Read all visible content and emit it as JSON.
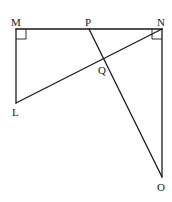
{
  "diagram": {
    "type": "geometry",
    "points": {
      "M": {
        "label": "M",
        "x": 16,
        "y": 29
      },
      "P": {
        "label": "P",
        "x": 89,
        "y": 29
      },
      "N": {
        "label": "N",
        "x": 162,
        "y": 29
      },
      "Q": {
        "label": "Q",
        "x": 104,
        "y": 60
      },
      "L": {
        "label": "L",
        "x": 16,
        "y": 103
      },
      "O": {
        "label": "O",
        "x": 162,
        "y": 177
      }
    },
    "segments": [
      [
        "M",
        "N"
      ],
      [
        "M",
        "L"
      ],
      [
        "L",
        "N"
      ],
      [
        "N",
        "O"
      ],
      [
        "P",
        "O"
      ]
    ],
    "right_angles": [
      "M",
      "N"
    ],
    "labels": {
      "M": "M",
      "P": "P",
      "N": "N",
      "Q": "Q",
      "L": "L",
      "O": "O"
    },
    "colors": {
      "line": "#1a1a1a",
      "background": "#ffffff"
    }
  }
}
